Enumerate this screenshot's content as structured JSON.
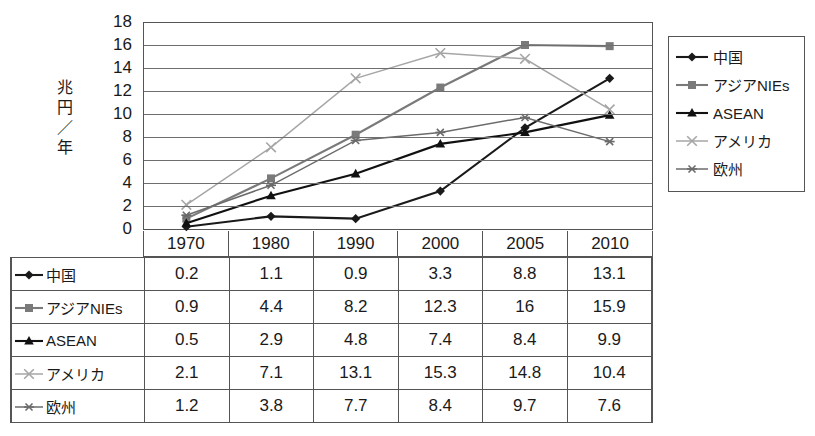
{
  "chart_data": {
    "type": "line",
    "title": "",
    "xlabel": "",
    "ylabel": "兆円／年",
    "ylim": [
      0,
      18
    ],
    "yticks": [
      0,
      2,
      4,
      6,
      8,
      10,
      12,
      14,
      16,
      18
    ],
    "grid": true,
    "legend_position": "right",
    "categories": [
      "1970",
      "1980",
      "1990",
      "2000",
      "2005",
      "2010"
    ],
    "series": [
      {
        "name": "中国",
        "marker": "diamond",
        "color": "#1a1a1a",
        "values": [
          0.2,
          1.1,
          0.9,
          3.3,
          8.8,
          13.1
        ],
        "display_values": [
          "0.2",
          "1.1",
          "0.9",
          "3.3",
          "8.8",
          "13.1"
        ]
      },
      {
        "name": "アジアNIEs",
        "marker": "square",
        "color": "#7a7a7a",
        "values": [
          0.9,
          4.4,
          8.2,
          12.3,
          16,
          15.9
        ],
        "display_values": [
          "0.9",
          "4.4",
          "8.2",
          "12.3",
          "16",
          "15.9"
        ]
      },
      {
        "name": "ASEAN",
        "marker": "triangle",
        "color": "#111111",
        "values": [
          0.5,
          2.9,
          4.8,
          7.4,
          8.4,
          9.9
        ],
        "display_values": [
          "0.5",
          "2.9",
          "4.8",
          "7.4",
          "8.4",
          "9.9"
        ]
      },
      {
        "name": "アメリカ",
        "marker": "cross",
        "color": "#a6a6a6",
        "values": [
          2.1,
          7.1,
          13.1,
          15.3,
          14.8,
          10.4
        ],
        "display_values": [
          "2.1",
          "7.1",
          "13.1",
          "15.3",
          "14.8",
          "10.4"
        ]
      },
      {
        "name": "欧州",
        "marker": "asterisk",
        "color": "#6b6b6b",
        "values": [
          1.2,
          3.8,
          7.7,
          8.4,
          9.7,
          7.6
        ],
        "display_values": [
          "1.2",
          "3.8",
          "7.7",
          "8.4",
          "9.7",
          "7.6"
        ]
      }
    ]
  },
  "axis": {
    "y_title": "兆円\n／\n年",
    "tick_18": "18",
    "tick_16": "16",
    "tick_14": "14",
    "tick_12": "12",
    "tick_10": "10",
    "tick_8": "8",
    "tick_6": "6",
    "tick_4": "4",
    "tick_2": "2",
    "tick_0": "0"
  },
  "legend": {
    "items": [
      {
        "label": "中国",
        "icon": "diamond-marker-icon"
      },
      {
        "label": "アジアNIEs",
        "icon": "square-marker-icon"
      },
      {
        "label": "ASEAN",
        "icon": "triangle-marker-icon"
      },
      {
        "label": "アメリカ",
        "icon": "cross-marker-icon"
      },
      {
        "label": "欧州",
        "icon": "asterisk-marker-icon"
      }
    ]
  },
  "table": {
    "column_headers": [
      "1970",
      "1980",
      "1990",
      "2000",
      "2005",
      "2010"
    ],
    "rows": [
      {
        "name": "中国",
        "cells": [
          "0.2",
          "1.1",
          "0.9",
          "3.3",
          "8.8",
          "13.1"
        ]
      },
      {
        "name": "アジアNIEs",
        "cells": [
          "0.9",
          "4.4",
          "8.2",
          "12.3",
          "16",
          "15.9"
        ]
      },
      {
        "name": "ASEAN",
        "cells": [
          "0.5",
          "2.9",
          "4.8",
          "7.4",
          "8.4",
          "9.9"
        ]
      },
      {
        "name": "アメリカ",
        "cells": [
          "2.1",
          "7.1",
          "13.1",
          "15.3",
          "14.8",
          "10.4"
        ]
      },
      {
        "name": "欧州",
        "cells": [
          "1.2",
          "3.8",
          "7.7",
          "8.4",
          "9.7",
          "7.6"
        ]
      }
    ]
  },
  "colors": {
    "china": "#1a1a1a",
    "asia_nies": "#7a7a7a",
    "asean": "#111111",
    "america": "#a6a6a6",
    "europe": "#6b6b6b",
    "grid": "#6e6e6e",
    "border": "#555555"
  }
}
